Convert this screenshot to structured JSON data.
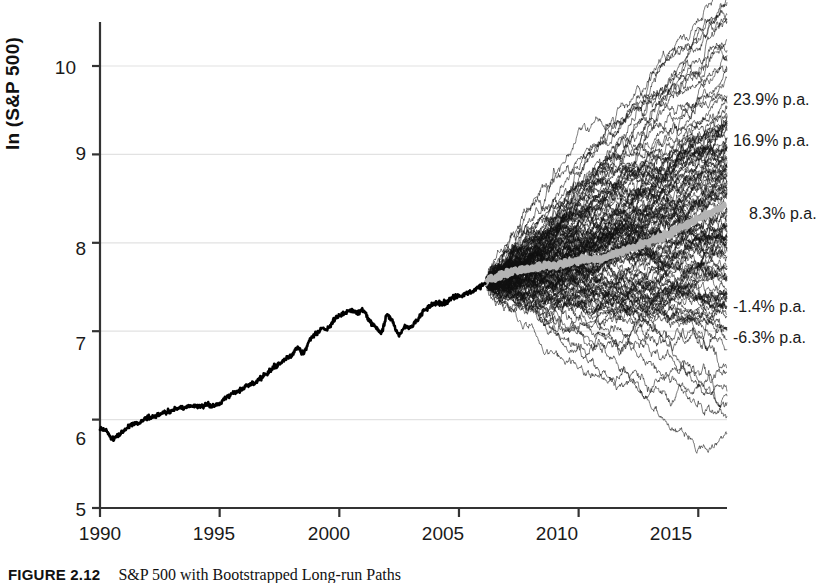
{
  "figure": {
    "caption_label": "FIGURE 2.12",
    "caption_text": "S&P 500 with Bootstrapped Long-run Paths"
  },
  "axes": {
    "ylabel": "ln (S&P 500)",
    "yticks": [
      "5",
      "6",
      "7",
      "8",
      "9",
      "10"
    ],
    "xticks": [
      "1990",
      "1995",
      "2000",
      "2005",
      "2010",
      "2015"
    ]
  },
  "annotations": [
    {
      "label": "23.9% p.a."
    },
    {
      "label": "16.9% p.a."
    },
    {
      "label": "8.3% p.a."
    },
    {
      "label": "-1.4% p.a."
    },
    {
      "label": "-6.3% p.a."
    }
  ],
  "chart_data": {
    "type": "line",
    "title": "",
    "xlabel": "",
    "ylabel": "ln (S&P 500)",
    "xlim": [
      1990,
      2016.2
    ],
    "ylim": [
      5,
      10.35
    ],
    "grid": true,
    "legend": "none",
    "colors": {
      "history": "#000000",
      "paths": "#111111",
      "median": "#b3b3b3",
      "grid": "#e2e2e2",
      "axis": "#333333"
    },
    "annotation_values_percent_pa": [
      23.9,
      16.9,
      8.3,
      -1.4,
      -6.3
    ],
    "annotation_terminal_ln": [
      9.63,
      9.22,
      8.42,
      7.49,
      7.18
    ],
    "forecast_start_year": 2006.1,
    "forecast_start_ln": 7.55,
    "n_simulated_paths": 120,
    "series": [
      {
        "name": "S&P 500 (historical, log)",
        "x": [
          1990.0,
          1990.25,
          1990.5,
          1990.75,
          1991.0,
          1991.25,
          1991.5,
          1991.75,
          1992.0,
          1992.25,
          1992.5,
          1992.75,
          1993.0,
          1993.25,
          1993.5,
          1993.75,
          1994.0,
          1994.25,
          1994.5,
          1994.75,
          1995.0,
          1995.25,
          1995.5,
          1995.75,
          1996.0,
          1996.25,
          1996.5,
          1996.75,
          1997.0,
          1997.25,
          1997.5,
          1997.75,
          1998.0,
          1998.25,
          1998.5,
          1998.75,
          1999.0,
          1999.25,
          1999.5,
          1999.75,
          2000.0,
          2000.25,
          2000.5,
          2000.75,
          2001.0,
          2001.25,
          2001.5,
          2001.75,
          2002.0,
          2002.25,
          2002.5,
          2002.75,
          2003.0,
          2003.25,
          2003.5,
          2003.75,
          2004.0,
          2004.25,
          2004.5,
          2004.75,
          2005.0,
          2005.25,
          2005.5,
          2005.75,
          2006.0,
          2006.1
        ],
        "y": [
          5.9,
          5.88,
          5.78,
          5.82,
          5.87,
          5.93,
          5.95,
          5.98,
          6.02,
          6.03,
          6.06,
          6.09,
          6.1,
          6.13,
          6.14,
          6.16,
          6.16,
          6.15,
          6.17,
          6.16,
          6.18,
          6.24,
          6.28,
          6.32,
          6.35,
          6.4,
          6.42,
          6.48,
          6.52,
          6.6,
          6.63,
          6.68,
          6.72,
          6.82,
          6.74,
          6.9,
          6.97,
          7.04,
          7.02,
          7.12,
          7.18,
          7.2,
          7.24,
          7.2,
          7.25,
          7.12,
          7.05,
          6.98,
          7.18,
          7.1,
          6.95,
          7.06,
          7.04,
          7.12,
          7.22,
          7.28,
          7.32,
          7.31,
          7.33,
          7.38,
          7.4,
          7.41,
          7.44,
          7.48,
          7.52,
          7.55
        ]
      },
      {
        "name": "Median simulated path",
        "x": [
          2006.1,
          2007,
          2008,
          2009,
          2010,
          2011,
          2012,
          2013,
          2014,
          2015,
          2016.1
        ],
        "y": [
          7.55,
          7.66,
          7.72,
          7.74,
          7.8,
          7.83,
          7.92,
          8.02,
          8.13,
          8.28,
          8.42
        ]
      }
    ]
  }
}
